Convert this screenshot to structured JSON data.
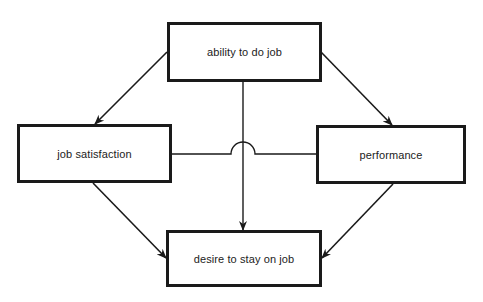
{
  "diagram": {
    "nodes": {
      "ability": {
        "label": "ability to do job"
      },
      "satisfaction": {
        "label": "job satisfaction"
      },
      "performance": {
        "label": "performance"
      },
      "desire": {
        "label": "desire to stay on job"
      }
    },
    "edges": [
      {
        "from": "ability to do job",
        "to": "job satisfaction",
        "type": "arrow"
      },
      {
        "from": "ability to do job",
        "to": "performance",
        "type": "arrow"
      },
      {
        "from": "ability to do job",
        "to": "desire to stay on job",
        "type": "arrow"
      },
      {
        "from": "job satisfaction",
        "to": "desire to stay on job",
        "type": "arrow"
      },
      {
        "from": "performance",
        "to": "desire to stay on job",
        "type": "arrow"
      },
      {
        "from": "job satisfaction",
        "to": "performance",
        "type": "line",
        "note": "undirected link, hops over vertical arrow"
      }
    ],
    "colors": {
      "stroke": "#1a1a1a",
      "background": "#ffffff"
    }
  }
}
